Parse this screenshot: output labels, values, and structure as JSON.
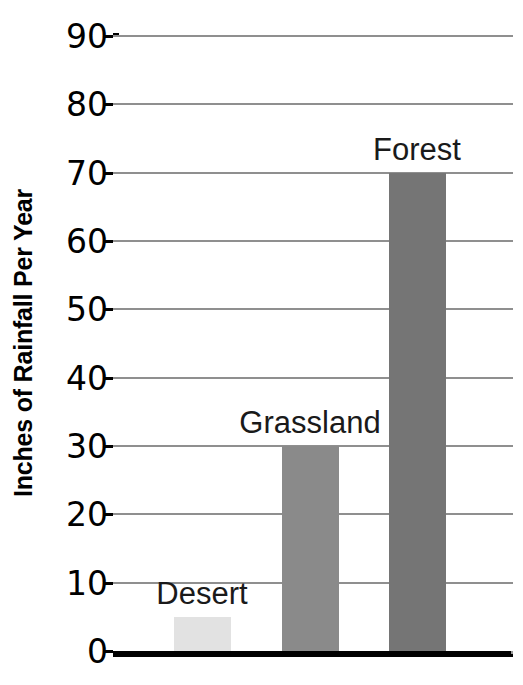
{
  "chart_data": {
    "type": "bar",
    "title": "",
    "xlabel": "",
    "ylabel": "Inches of Rainfall Per Year",
    "categories": [
      "Desert",
      "Grassland",
      "Forest"
    ],
    "values": [
      5,
      30,
      70
    ],
    "ylim": [
      0,
      90
    ],
    "y_ticks": [
      0,
      10,
      20,
      30,
      40,
      50,
      60,
      70,
      80,
      90
    ],
    "y_tick_labels": [
      "0",
      "10",
      "20",
      "30",
      "40",
      "50",
      "60",
      "70",
      "80",
      "90"
    ],
    "grid": true,
    "legend": "none",
    "bar_colors": [
      "#e2e2e2",
      "#8a8a8a",
      "#757575"
    ],
    "bar_labels_position": "above-bar-inside-plot",
    "axis_color": "#000000",
    "gridline_color": "#8f8f8f",
    "background": "#ffffff"
  },
  "axis": {
    "y_title": "Inches of Rainfall Per Year"
  },
  "bars": [
    {
      "label": "Desert",
      "value": 5,
      "color": "#e2e2e2"
    },
    {
      "label": "Grassland",
      "value": 30,
      "color": "#8a8a8a"
    },
    {
      "label": "Forest",
      "value": 70,
      "color": "#757575"
    }
  ]
}
